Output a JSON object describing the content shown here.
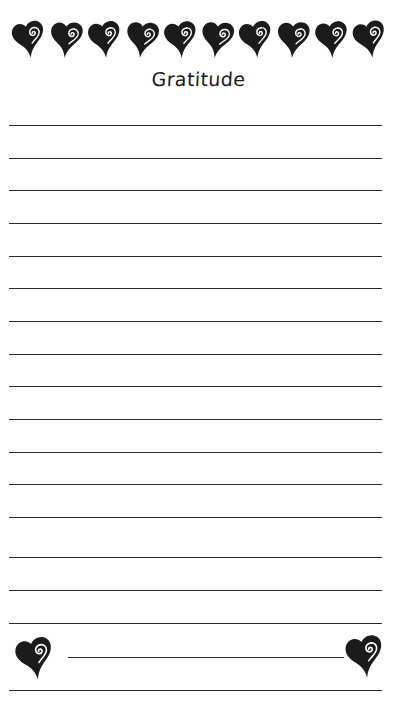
{
  "page": {
    "title": "Gratitude",
    "background_color": "#ffffff",
    "ink_color": "#2b2b2b",
    "width": 397,
    "height": 724
  },
  "header": {
    "title": "Gratitude",
    "border_icon": "heart-swirl-icon",
    "border_heart_count": 10
  },
  "lines": {
    "count": 16,
    "full_width_y": [
      125,
      158,
      190,
      223,
      256,
      288,
      321,
      354,
      386,
      419,
      452,
      484,
      517,
      557,
      590,
      623
    ],
    "footer_line_y": 657,
    "closing_line_y": 690,
    "left_x": 9,
    "right_x": 382,
    "short_left_x": 68,
    "short_right_x": 344
  },
  "footer": {
    "left_icon": "heart-swirl-icon",
    "right_icon": "heart-swirl-icon"
  }
}
